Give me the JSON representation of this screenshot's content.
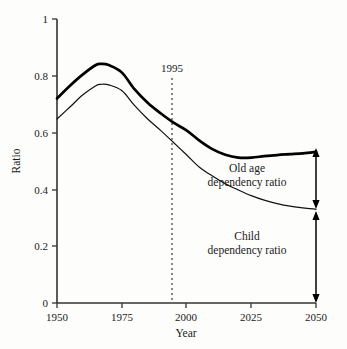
{
  "chart_data": {
    "type": "line",
    "title": "",
    "xlabel": "Year",
    "ylabel": "Ratio",
    "xlim": [
      1950,
      2050
    ],
    "ylim": [
      0,
      1
    ],
    "grid": false,
    "legend_position": "inline-annotations",
    "x_ticks": [
      "1950",
      "1975",
      "2000",
      "2025",
      "2050"
    ],
    "x_tick_values": [
      1950,
      1975,
      2000,
      2025,
      2050
    ],
    "y_ticks": [
      "0",
      "0.2",
      "0.4",
      "0.6",
      "0.8",
      "1"
    ],
    "y_tick_values": [
      0,
      0.2,
      0.4,
      0.6,
      0.8,
      1
    ],
    "x": [
      1950,
      1955,
      1960,
      1965,
      1967,
      1970,
      1975,
      1980,
      1985,
      1990,
      1995,
      2000,
      2005,
      2010,
      2015,
      2020,
      2025,
      2030,
      2035,
      2040,
      2045,
      2050
    ],
    "series": [
      {
        "name": "Total dependency ratio",
        "style": "thick",
        "values": [
          0.72,
          0.765,
          0.805,
          0.838,
          0.842,
          0.838,
          0.812,
          0.752,
          0.705,
          0.668,
          0.635,
          0.608,
          0.572,
          0.542,
          0.522,
          0.512,
          0.512,
          0.517,
          0.521,
          0.524,
          0.527,
          0.532
        ]
      },
      {
        "name": "Child dependency ratio",
        "style": "thin",
        "values": [
          0.648,
          0.69,
          0.733,
          0.765,
          0.77,
          0.768,
          0.748,
          0.695,
          0.648,
          0.608,
          0.565,
          0.522,
          0.478,
          0.447,
          0.42,
          0.398,
          0.378,
          0.362,
          0.35,
          0.341,
          0.335,
          0.33
        ]
      }
    ],
    "annotations": [
      {
        "name": "year-marker",
        "label": "1995",
        "x_value": 1995,
        "style": "dotted-vertical-line"
      },
      {
        "name": "old-age-bracket",
        "label_line1": "Old age",
        "label_line2": "dependency ratio",
        "from_value": 0.33,
        "to_value": 0.532,
        "at_year": 2050,
        "style": "double-arrow"
      },
      {
        "name": "child-bracket",
        "label_line1": "Child",
        "label_line2": "dependency ratio",
        "from_value": 0.0,
        "to_value": 0.33,
        "at_year": 2050,
        "style": "double-arrow"
      }
    ],
    "colors": {
      "axis": "#333333",
      "line_thick": "#000000",
      "line_thin": "#111111",
      "marker_line": "#555555",
      "background": "#fdfdfc"
    }
  }
}
